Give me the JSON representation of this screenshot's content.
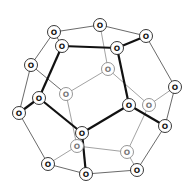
{
  "diagram": {
    "type": "dodecahedron-graph",
    "node_label": "O",
    "colors": {
      "front": "#222222",
      "back": "#8a8a8a",
      "thick": "#111111"
    },
    "nodes": [
      {
        "id": 0,
        "x": 100,
        "y": 25,
        "label": "O",
        "layer": "front"
      },
      {
        "id": 1,
        "x": 54,
        "y": 32,
        "label": "O",
        "layer": "front"
      },
      {
        "id": 2,
        "x": 146,
        "y": 36,
        "label": "O",
        "layer": "front"
      },
      {
        "id": 3,
        "x": 62,
        "y": 46,
        "label": "O",
        "layer": "front"
      },
      {
        "id": 4,
        "x": 117,
        "y": 48,
        "label": "O",
        "layer": "front"
      },
      {
        "id": 5,
        "x": 31,
        "y": 65,
        "label": "O",
        "layer": "front"
      },
      {
        "id": 6,
        "x": 108,
        "y": 69,
        "label": "O",
        "layer": "back"
      },
      {
        "id": 7,
        "x": 175,
        "y": 87,
        "label": "O",
        "layer": "front"
      },
      {
        "id": 8,
        "x": 66,
        "y": 94,
        "label": "O",
        "layer": "back"
      },
      {
        "id": 9,
        "x": 39,
        "y": 98,
        "label": "O",
        "layer": "front"
      },
      {
        "id": 10,
        "x": 129,
        "y": 105,
        "label": "O",
        "layer": "front"
      },
      {
        "id": 11,
        "x": 149,
        "y": 105,
        "label": "O",
        "layer": "back"
      },
      {
        "id": 12,
        "x": 19,
        "y": 113,
        "label": "O",
        "layer": "front"
      },
      {
        "id": 13,
        "x": 165,
        "y": 126,
        "label": "O",
        "layer": "front"
      },
      {
        "id": 14,
        "x": 82,
        "y": 133,
        "label": "O",
        "layer": "front"
      },
      {
        "id": 15,
        "x": 77,
        "y": 146,
        "label": "O",
        "layer": "back"
      },
      {
        "id": 16,
        "x": 127,
        "y": 152,
        "label": "O",
        "layer": "back"
      },
      {
        "id": 17,
        "x": 48,
        "y": 164,
        "label": "O",
        "layer": "front"
      },
      {
        "id": 18,
        "x": 137,
        "y": 170,
        "label": "O",
        "layer": "front"
      },
      {
        "id": 19,
        "x": 86,
        "y": 174,
        "label": "O",
        "layer": "front"
      }
    ],
    "edges": [
      {
        "from": 0,
        "to": 1,
        "style": "thin"
      },
      {
        "from": 0,
        "to": 2,
        "style": "thin"
      },
      {
        "from": 0,
        "to": 6,
        "style": "back"
      },
      {
        "from": 1,
        "to": 5,
        "style": "thin"
      },
      {
        "from": 1,
        "to": 3,
        "style": "thin"
      },
      {
        "from": 3,
        "to": 4,
        "style": "thick"
      },
      {
        "from": 3,
        "to": 9,
        "style": "thick"
      },
      {
        "from": 2,
        "to": 4,
        "style": "thick"
      },
      {
        "from": 2,
        "to": 7,
        "style": "thin"
      },
      {
        "from": 4,
        "to": 10,
        "style": "thick"
      },
      {
        "from": 6,
        "to": 8,
        "style": "back"
      },
      {
        "from": 6,
        "to": 11,
        "style": "back"
      },
      {
        "from": 5,
        "to": 8,
        "style": "thin"
      },
      {
        "from": 5,
        "to": 12,
        "style": "thin"
      },
      {
        "from": 9,
        "to": 12,
        "style": "thick"
      },
      {
        "from": 9,
        "to": 14,
        "style": "thick"
      },
      {
        "from": 10,
        "to": 14,
        "style": "thick"
      },
      {
        "from": 10,
        "to": 13,
        "style": "thick"
      },
      {
        "from": 11,
        "to": 7,
        "style": "back"
      },
      {
        "from": 7,
        "to": 13,
        "style": "thin"
      },
      {
        "from": 8,
        "to": 15,
        "style": "back"
      },
      {
        "from": 12,
        "to": 17,
        "style": "thin"
      },
      {
        "from": 14,
        "to": 19,
        "style": "thick"
      },
      {
        "from": 15,
        "to": 17,
        "style": "back"
      },
      {
        "from": 15,
        "to": 16,
        "style": "back"
      },
      {
        "from": 16,
        "to": 11,
        "style": "back"
      },
      {
        "from": 16,
        "to": 18,
        "style": "back"
      },
      {
        "from": 13,
        "to": 18,
        "style": "thin"
      },
      {
        "from": 17,
        "to": 19,
        "style": "thin"
      },
      {
        "from": 19,
        "to": 18,
        "style": "thin"
      }
    ]
  }
}
